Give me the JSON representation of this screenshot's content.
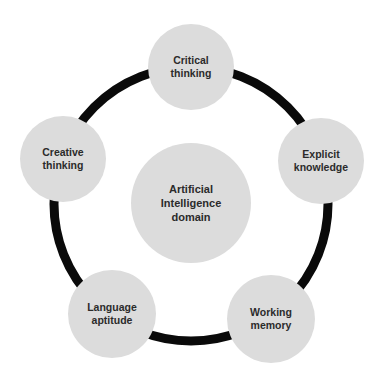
{
  "diagram": {
    "type": "cycle",
    "ring_color": "#0a0a0a",
    "node_color": "#dcdcdc",
    "text_color": "#2b2b2b",
    "center": {
      "lines": [
        "Artificial",
        "Intelligence",
        "domain"
      ]
    },
    "nodes": [
      {
        "id": "critical-thinking",
        "lines": [
          "Critical",
          "thinking"
        ]
      },
      {
        "id": "explicit-knowledge",
        "lines": [
          "Explicit",
          "knowledge"
        ]
      },
      {
        "id": "working-memory",
        "lines": [
          "Working",
          "memory"
        ]
      },
      {
        "id": "language-aptitude",
        "lines": [
          "Language",
          "aptitude"
        ]
      },
      {
        "id": "creative-thinking",
        "lines": [
          "Creative",
          "thinking"
        ]
      }
    ]
  }
}
